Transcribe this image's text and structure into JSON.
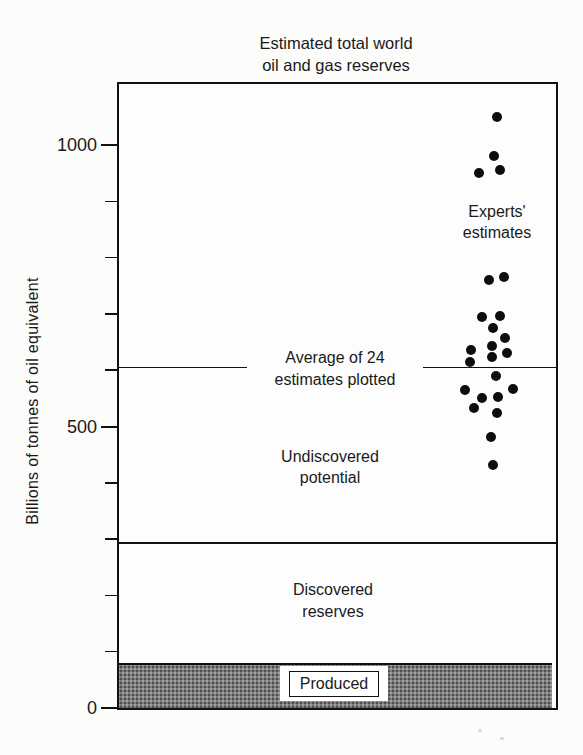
{
  "title": {
    "line1": "Estimated total world",
    "line2": "oil and gas reserves"
  },
  "y_axis": {
    "label": "Billions of tonnes of oil equivalent",
    "major_ticks": [
      {
        "value": 0,
        "label": "0"
      },
      {
        "value": 500,
        "label": "500"
      },
      {
        "value": 1000,
        "label": "1000"
      }
    ],
    "minor_tick_values": [
      100,
      200,
      300,
      400,
      600,
      700,
      800,
      900
    ]
  },
  "annotations": {
    "experts": {
      "line1": "Experts'",
      "line2": "estimates"
    },
    "average": {
      "line1": "Average of 24",
      "line2": "estimates plotted"
    },
    "undiscovered": {
      "line1": "Undiscovered",
      "line2": "potential"
    },
    "discovered": {
      "line1": "Discovered",
      "line2": "reserves"
    },
    "produced": {
      "label": "Produced"
    }
  },
  "colors": {
    "ink": "#111111",
    "dot": "#0d0d0d",
    "produced_band_gray": "#7e7e7e",
    "background": "#fcfcfb"
  },
  "chart_data": {
    "type": "scatter",
    "title": "Estimated total world oil and gas reserves",
    "ylabel": "Billions of tonnes of oil equivalent",
    "ylim": [
      0,
      1110
    ],
    "grid": false,
    "series_label": "Experts' estimates",
    "points_unit": "billions of tonnes of oil equivalent",
    "points": [
      {
        "value": 1050,
        "dx": 4
      },
      {
        "value": 980,
        "dx": 1
      },
      {
        "value": 950,
        "dx": -14
      },
      {
        "value": 955,
        "dx": 7
      },
      {
        "value": 760,
        "dx": -4
      },
      {
        "value": 765,
        "dx": 11
      },
      {
        "value": 695,
        "dx": -11
      },
      {
        "value": 696,
        "dx": 7
      },
      {
        "value": 675,
        "dx": 0
      },
      {
        "value": 657,
        "dx": 12
      },
      {
        "value": 643,
        "dx": -1
      },
      {
        "value": 635,
        "dx": -22
      },
      {
        "value": 630,
        "dx": 14
      },
      {
        "value": 623,
        "dx": -1
      },
      {
        "value": 615,
        "dx": -23
      },
      {
        "value": 590,
        "dx": 3
      },
      {
        "value": 566,
        "dx": 20
      },
      {
        "value": 565,
        "dx": -28
      },
      {
        "value": 552,
        "dx": 5
      },
      {
        "value": 550,
        "dx": -11
      },
      {
        "value": 533,
        "dx": -19
      },
      {
        "value": 524,
        "dx": 4
      },
      {
        "value": 481,
        "dx": -2
      },
      {
        "value": 432,
        "dx": 0
      }
    ],
    "average_line": {
      "value": 605,
      "label": "Average of 24 estimates plotted"
    },
    "zones": [
      {
        "name": "Produced",
        "from": 0,
        "to": 80,
        "style": "gray-stipple"
      },
      {
        "name": "Discovered reserves",
        "from": 80,
        "to": 293,
        "style": "white"
      },
      {
        "name": "Undiscovered potential",
        "from": 293,
        "to": 1110,
        "style": "white"
      }
    ]
  }
}
